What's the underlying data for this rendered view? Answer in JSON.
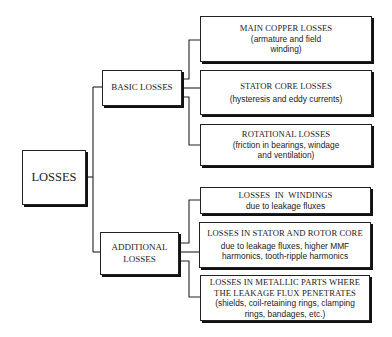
{
  "diagram": {
    "type": "tree",
    "root": {
      "label": "LOSSES"
    },
    "branches": [
      {
        "label": "BASIC LOSSES",
        "children": [
          {
            "title": "MAIN COPPER LOSSES",
            "detail_lines": [
              "(armature and field",
              "winding)"
            ]
          },
          {
            "title": "STATOR CORE LOSSES",
            "detail_lines": [
              "(hysteresis and eddy currents)"
            ]
          },
          {
            "title": "ROTATIONAL LOSSES",
            "detail_lines": [
              "(friction in bearings, windage",
              "and ventilation)"
            ]
          }
        ]
      },
      {
        "label_lines": [
          "ADDITIONAL",
          "LOSSES"
        ],
        "children": [
          {
            "title": "LOSSES  IN  WINDINGS",
            "detail_lines": [
              "due to leakage fluxes"
            ]
          },
          {
            "title": "LOSSES IN STATOR AND ROTOR CORE",
            "detail_lines": [
              "due to leakage fluxes, higher MMF",
              "harmonics, tooth-ripple harmonics"
            ]
          },
          {
            "title_lines": [
              "LOSSES IN METALLIC PARTS WHERE",
              "THE LEAKAGE FLUX PENETRATES"
            ],
            "detail_lines": [
              "(shields, coil-retaining rings, clamping",
              "rings, bandages, etc.)"
            ]
          }
        ]
      }
    ]
  },
  "colors": {
    "line": "#222222",
    "background": "#ffffff",
    "shadow": "#111111"
  }
}
